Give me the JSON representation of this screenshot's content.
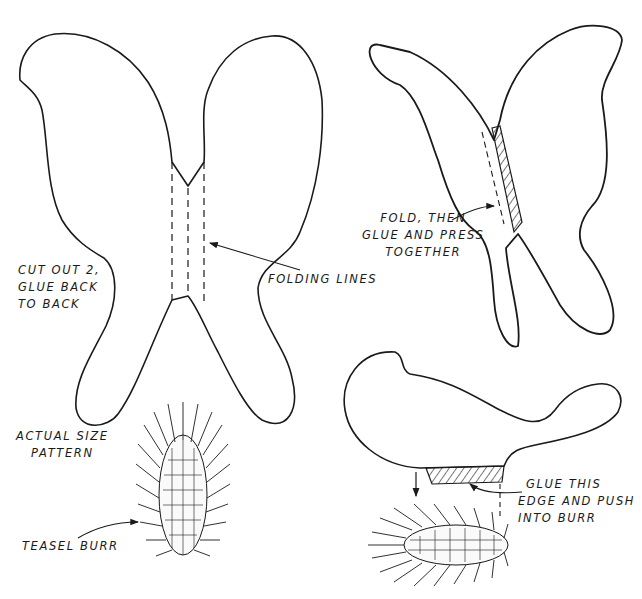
{
  "diagram": {
    "type": "craft-pattern",
    "colors": {
      "ink": "#1a1a1a",
      "paper": "#ffffff"
    },
    "labels": {
      "cut_out": [
        "CUT OUT 2,",
        "GLUE BACK",
        "TO BACK"
      ],
      "folding_lines": "FOLDING LINES",
      "fold_then": [
        "FOLD, THEN",
        "GLUE AND PRESS",
        "TOGETHER"
      ],
      "actual_size": [
        "ACTUAL SIZE",
        "PATTERN"
      ],
      "teasel_burr": "TEASEL BURR",
      "glue_edge": [
        "GLUE THIS",
        "EDGE AND PUSH",
        "INTO BURR"
      ]
    },
    "figures": [
      {
        "id": "butterfly-pattern-flat",
        "description": "Butterfly wing pattern with three dashed folding lines"
      },
      {
        "id": "butterfly-folded",
        "description": "Folded butterfly showing hatched glue area"
      },
      {
        "id": "butterfly-side",
        "description": "Side view of assembled butterfly with hatched glue edge"
      },
      {
        "id": "teasel-burr-upright",
        "description": "Teasel burr drawn upright"
      },
      {
        "id": "teasel-burr-horizontal",
        "description": "Teasel burr drawn horizontally"
      }
    ]
  }
}
